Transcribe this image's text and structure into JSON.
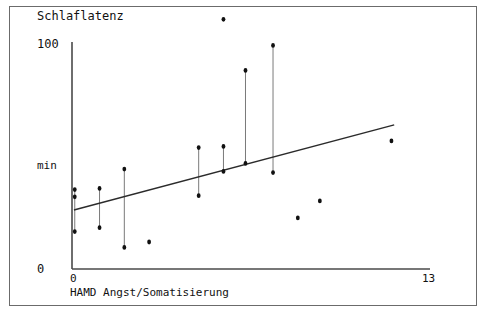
{
  "chart_data": {
    "type": "scatter",
    "title": "Schlaflatenz",
    "xlabel": "HAMD Angst/Somatisierung",
    "ylabel": "min",
    "xlim": [
      0,
      13
    ],
    "ylim": [
      0,
      100
    ],
    "xticks": [
      "0",
      "13"
    ],
    "yticks": [
      "0",
      "100"
    ],
    "grid": false,
    "legend": null,
    "axes_px": {
      "x0": 72,
      "x1": 430,
      "y_top": 42,
      "y_bottom": 269,
      "x_value_min": 0,
      "x_value_max": 13,
      "y_value_min": 0,
      "y_value_max": 100
    },
    "note": "Vertical connector lines join repeated measurements at the same x value; points drawn as small filled markers.",
    "connector_lines": [
      {
        "x": 0.1,
        "y_top": 35.0,
        "y_bottom": 16.5
      },
      {
        "x": 1.0,
        "y_top": 35.5,
        "y_bottom": 18.2
      },
      {
        "x": 1.9,
        "y_top": 44.0,
        "y_bottom": 9.5
      },
      {
        "x": 4.6,
        "y_top": 53.5,
        "y_bottom": 32.3
      },
      {
        "x": 5.5,
        "y_top": 54.0,
        "y_bottom": 43.0
      },
      {
        "x": 6.3,
        "y_top": 87.5,
        "y_bottom": 46.5
      },
      {
        "x": 7.3,
        "y_top": 98.5,
        "y_bottom": 42.5
      }
    ],
    "points": [
      {
        "x": 0.1,
        "y": 35.0
      },
      {
        "x": 0.1,
        "y": 31.8
      },
      {
        "x": 0.1,
        "y": 16.5
      },
      {
        "x": 1.0,
        "y": 35.5
      },
      {
        "x": 1.0,
        "y": 18.2
      },
      {
        "x": 1.9,
        "y": 44.0
      },
      {
        "x": 1.9,
        "y": 9.5
      },
      {
        "x": 2.8,
        "y": 11.9
      },
      {
        "x": 4.6,
        "y": 53.5
      },
      {
        "x": 4.6,
        "y": 32.3
      },
      {
        "x": 5.5,
        "y": 54.0
      },
      {
        "x": 5.5,
        "y": 43.0
      },
      {
        "x": 6.3,
        "y": 87.5
      },
      {
        "x": 6.3,
        "y": 46.5
      },
      {
        "x": 7.3,
        "y": 98.5
      },
      {
        "x": 7.3,
        "y": 42.5
      },
      {
        "x": 8.2,
        "y": 22.5
      },
      {
        "x": 9.0,
        "y": 30.0
      },
      {
        "x": 11.6,
        "y": 56.4
      },
      {
        "x": 5.5,
        "y": 110.0
      }
    ],
    "regression_line": {
      "x_start": 0.07,
      "y_start": 26.0,
      "x_end": 11.7,
      "y_end": 63.5,
      "style": "solid"
    }
  }
}
